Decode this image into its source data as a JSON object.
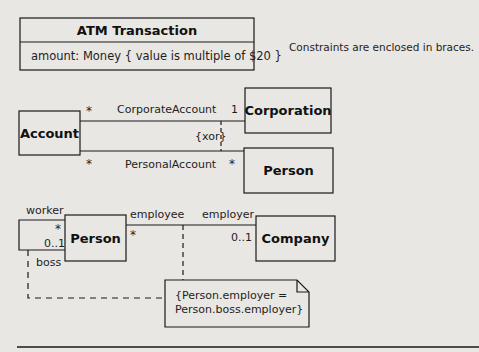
{
  "atm": {
    "title": "ATM Transaction",
    "attribute": "amount: Money { value is multiple of $20 }"
  },
  "caption": "Constraints are enclosed in braces.",
  "xor_diagram": {
    "account": "Account",
    "corporation": "Corporation",
    "person": "Person",
    "corporate_assoc": {
      "name": "CorporateAccount",
      "account_mult": "*",
      "corporation_mult": "1"
    },
    "personal_assoc": {
      "name": "PersonalAccount",
      "account_mult": "*",
      "person_mult": "*"
    },
    "constraint": "{xor}"
  },
  "employment_diagram": {
    "person": "Person",
    "company": "Company",
    "self_assoc": {
      "worker_role": "worker",
      "worker_mult": "*",
      "boss_role": "boss",
      "boss_mult": "0..1"
    },
    "employ_assoc": {
      "employee_role": "employee",
      "employee_mult": "*",
      "employer_role": "employer",
      "employer_mult": "0..1"
    },
    "note": {
      "line1": "{Person.employer =",
      "line2": "Person.boss.employer}"
    }
  },
  "colors": {
    "background": "#e9e7e3",
    "line": "#1a1a1a"
  }
}
